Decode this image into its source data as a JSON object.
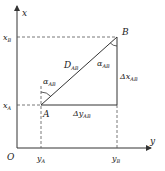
{
  "diagram": {
    "type": "coordinate-azimuth",
    "axes": {
      "vertical_label": "x",
      "horizontal_label": "y",
      "origin_label": "O"
    },
    "points": {
      "A": {
        "label": "A",
        "x_label": "x",
        "x_sub": "A",
        "y_label": "y",
        "y_sub": "A"
      },
      "B": {
        "label": "B",
        "x_label": "x",
        "x_sub": "B",
        "y_label": "y",
        "y_sub": "B"
      }
    },
    "segment": {
      "label": "D",
      "sub": "AB"
    },
    "angle_at_A": {
      "label": "α",
      "sub": "AB"
    },
    "angle_at_B": {
      "label": "α",
      "sub": "AB"
    },
    "delta_x": {
      "label": "Δx",
      "sub": "AB"
    },
    "delta_y": {
      "label": "Δy",
      "sub": "AB"
    },
    "colors": {
      "line": "#333333",
      "background": "#ffffff"
    }
  }
}
